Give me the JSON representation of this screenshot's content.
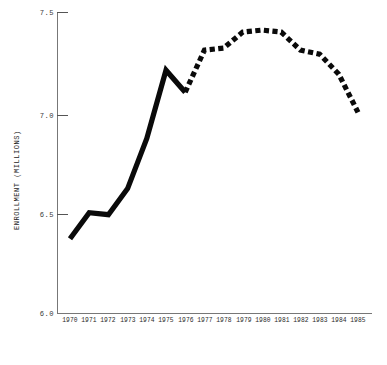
{
  "chart_data": {
    "type": "line",
    "title": "",
    "xlabel": "",
    "ylabel": "ENROLLMENT (MILLIONS)",
    "x": [
      1970,
      1971,
      1972,
      1973,
      1974,
      1975,
      1976,
      1977,
      1978,
      1979,
      1980,
      1981,
      1982,
      1983,
      1984,
      1985
    ],
    "categories": [
      "1970",
      "1971",
      "1972",
      "1973",
      "1974",
      "1975",
      "1976",
      "1977",
      "1978",
      "1979",
      "1980",
      "1981",
      "1982",
      "1983",
      "1984",
      "1985"
    ],
    "series": [
      {
        "name": "Enrollment (actual)",
        "style": "solid",
        "values": [
          6.37,
          6.5,
          6.49,
          6.62,
          6.87,
          7.21,
          7.1,
          null,
          null,
          null,
          null,
          null,
          null,
          null,
          null,
          null
        ]
      },
      {
        "name": "Enrollment (projected)",
        "style": "dashed",
        "values": [
          null,
          null,
          null,
          null,
          null,
          null,
          7.1,
          7.31,
          7.32,
          7.4,
          7.41,
          7.4,
          7.31,
          7.29,
          7.19,
          7.0
        ]
      }
    ],
    "values": [
      6.37,
      6.5,
      6.49,
      6.62,
      6.87,
      7.21,
      7.1,
      7.31,
      7.32,
      7.4,
      7.41,
      7.4,
      7.31,
      7.29,
      7.19,
      7.0
    ],
    "xlim": [
      1970,
      1985
    ],
    "ylim": [
      6.0,
      7.5
    ],
    "yticks": [
      "6.0",
      "6.5",
      "7.0",
      "7.5"
    ],
    "ytick_values": [
      6.0,
      6.5,
      7.0,
      7.5
    ],
    "grid": false,
    "legend": "none",
    "line_color": "#0a0a0a",
    "axis_color": "#777777"
  },
  "axes": {
    "y_title": "ENROLLMENT (MILLIONS)",
    "y_labels": [
      "7.5",
      "7.0",
      "6.5",
      "6.0"
    ],
    "x_labels": [
      "1970",
      "1971",
      "1972",
      "1973",
      "1974",
      "1975",
      "1976",
      "1977",
      "1978",
      "1979",
      "1980",
      "1981",
      "1982",
      "1983",
      "1984",
      "1985"
    ]
  },
  "footer": {
    "caption": ""
  }
}
